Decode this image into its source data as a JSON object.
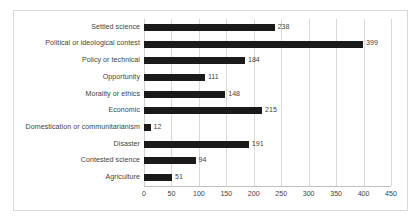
{
  "chart_data": {
    "type": "bar",
    "orientation": "horizontal",
    "title": "",
    "xlabel": "",
    "ylabel": "",
    "xlim": [
      0,
      450
    ],
    "xticks": [
      0,
      50,
      100,
      150,
      200,
      250,
      300,
      350,
      400,
      450
    ],
    "grid": true,
    "legend": false,
    "bar_color": "#1a1a1a",
    "categories": [
      "Settled science",
      "Political or ideological contest",
      "Policy or technical",
      "Opportunity",
      "Morality or ethics",
      "Economic",
      "Domestication or communitarianism",
      "Disaster",
      "Contested science",
      "Agriculture"
    ],
    "values": [
      238,
      399,
      184,
      111,
      148,
      215,
      12,
      191,
      94,
      51
    ],
    "data_labels": [
      "238",
      "399",
      "184",
      "111",
      "148",
      "215",
      "12",
      "191",
      "94",
      "51"
    ],
    "tick_labels": [
      "0",
      "50",
      "100",
      "150",
      "200",
      "250",
      "300",
      "350",
      "400",
      "450"
    ]
  },
  "figure": {
    "border_color": "#d9d9d9",
    "background": "#ffffff"
  }
}
